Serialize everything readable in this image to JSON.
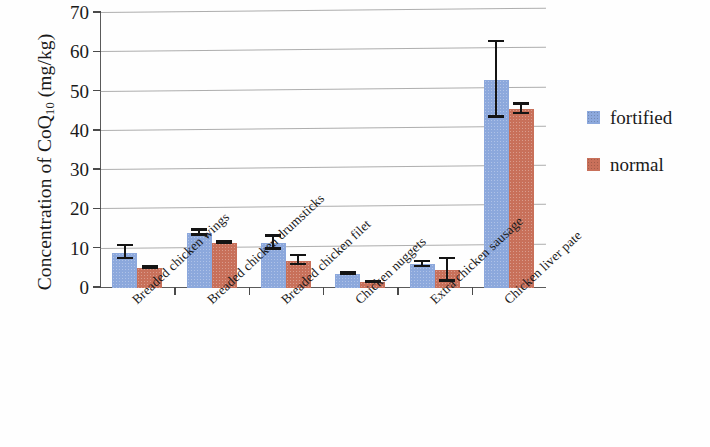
{
  "chart_data": {
    "type": "bar",
    "title": "",
    "xlabel": "",
    "ylabel": "Concentration of CoQ10 (mg/kg)",
    "ylabel_parts": {
      "prefix": "Concentration of CoQ",
      "sub": "10",
      "suffix": " (mg/kg)"
    },
    "ylim": [
      0,
      70
    ],
    "yticks": [
      0,
      10,
      20,
      30,
      40,
      50,
      60,
      70
    ],
    "ytick_labels": [
      "0",
      "10",
      "20",
      "30",
      "40",
      "50",
      "60",
      "70"
    ],
    "grid": true,
    "legend_position": "right",
    "categories": [
      "Breaded chicken wings",
      "Breaded chicken drumsticks",
      "Breaded chicken filet",
      "Chicken nuggets",
      "Extra chicken sausage",
      "Chicken liver pate"
    ],
    "series": [
      {
        "name": "fortified",
        "color": "#8ca8dc",
        "values": [
          9.0,
          14.0,
          11.5,
          3.5,
          6.0,
          53.0
        ],
        "errors": [
          2.0,
          1.0,
          2.0,
          0.5,
          1.0,
          10.0
        ]
      },
      {
        "name": "normal",
        "color": "#c8705a",
        "values": [
          5.0,
          11.5,
          7.0,
          1.5,
          4.5,
          45.5
        ],
        "errors": [
          0.5,
          0.5,
          1.5,
          0.4,
          3.2,
          1.5
        ]
      }
    ]
  },
  "legend": {
    "entries": [
      {
        "label": "fortified",
        "color": "#8ca8dc"
      },
      {
        "label": "normal",
        "color": "#c8705a"
      }
    ]
  }
}
